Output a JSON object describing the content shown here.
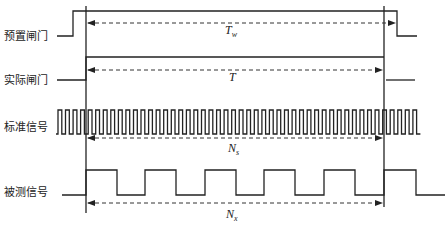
{
  "diagram": {
    "type": "timing-diagram",
    "signals": [
      {
        "label": "预置闸门",
        "id": "preset-gate"
      },
      {
        "label": "实际闸门",
        "id": "actual-gate"
      },
      {
        "label": "标准信号",
        "id": "standard-signal"
      },
      {
        "label": "被测信号",
        "id": "measured-signal"
      }
    ],
    "intervals": [
      {
        "symbol": "T",
        "subscript": "w",
        "row": "preset-gate"
      },
      {
        "symbol": "T",
        "subscript": "",
        "row": "actual-gate"
      },
      {
        "symbol": "N",
        "subscript": "s",
        "row": "standard-signal"
      },
      {
        "symbol": "N",
        "subscript": "x",
        "row": "measured-signal"
      }
    ],
    "colors": {
      "line": "#222222",
      "background": "#ffffff"
    }
  }
}
